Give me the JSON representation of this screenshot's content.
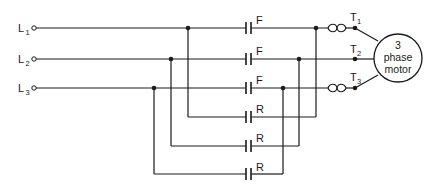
{
  "diagram": {
    "lines": [
      {
        "label": "L",
        "sub": "1"
      },
      {
        "label": "L",
        "sub": "2"
      },
      {
        "label": "L",
        "sub": "3"
      }
    ],
    "forward_contacts": [
      {
        "label": "F"
      },
      {
        "label": "F"
      },
      {
        "label": "F"
      }
    ],
    "reverse_contacts": [
      {
        "label": "R"
      },
      {
        "label": "R"
      },
      {
        "label": "R"
      }
    ],
    "terminals": [
      {
        "label": "T",
        "sub": "1"
      },
      {
        "label": "T",
        "sub": "2"
      },
      {
        "label": "T",
        "sub": "3"
      }
    ],
    "motor": {
      "line1": "3",
      "line2": "phase",
      "line3": "motor"
    },
    "colors": {
      "ink": "#1a1a1a",
      "background": "#ffffff"
    }
  }
}
